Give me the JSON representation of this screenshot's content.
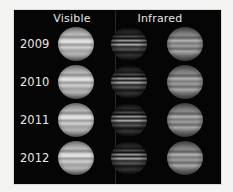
{
  "figure": {
    "columns": [
      {
        "label": "Visible",
        "kind": "visible"
      },
      {
        "label": "Infrared",
        "kind": "infrared-processed"
      },
      {
        "label": "",
        "kind": "infrared"
      }
    ],
    "rows": [
      {
        "year": "2009"
      },
      {
        "year": "2010"
      },
      {
        "year": "2011"
      },
      {
        "year": "2012"
      }
    ],
    "colors": {
      "panel_background": "#050505",
      "page_background": "#f4f4f2",
      "label_text": "#e6e6e6"
    }
  }
}
